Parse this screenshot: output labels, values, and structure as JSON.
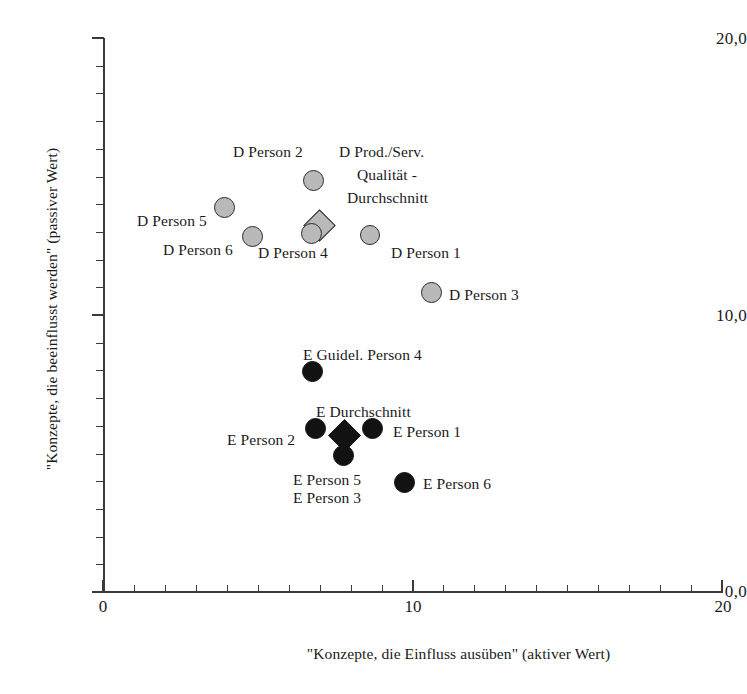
{
  "chart_data": {
    "type": "scatter",
    "title": "",
    "subtitle": "",
    "xlabel": "\"Konzepte, die Einfluss ausüben\" (aktiver Wert)",
    "ylabel": "\"Konzepte, die beeinflusst werden\" (passiver Wert)",
    "xlim": [
      0,
      20
    ],
    "ylim": [
      0,
      20
    ],
    "x_major_ticks": [
      "0",
      "10",
      "20"
    ],
    "x_major_tick_values": [
      0,
      10,
      20
    ],
    "y_major_ticks": [
      "0,0",
      "10,0",
      "20,0"
    ],
    "y_major_tick_values": [
      0,
      10,
      20
    ],
    "x_minor_tick_step": 1,
    "y_minor_tick_step": 1,
    "grid": false,
    "legend": "none",
    "series": [
      {
        "name": "D (Dimensionen) - hellgrau",
        "marker": "circle",
        "fill": "#b9b9b9",
        "edge": "#2b2b2b",
        "points": [
          {
            "label": "D Person 5",
            "x": 3.9,
            "y": 13.9
          },
          {
            "label": "D Person 6",
            "x": 4.8,
            "y": 12.9
          },
          {
            "label": "D Person 2",
            "x": 6.8,
            "y": 14.9
          },
          {
            "label": "D Person 4",
            "x": 6.7,
            "y": 13.0
          },
          {
            "label": "D Person 1",
            "x": 8.6,
            "y": 12.9
          },
          {
            "label": "D Person 3",
            "x": 10.6,
            "y": 10.8
          }
        ]
      },
      {
        "name": "D Prod./Serv. Qualität - Durchschnitt",
        "marker": "diamond",
        "fill": "#b9b9b9",
        "edge": "#2b2b2b",
        "points": [
          {
            "label": "D Prod./Serv. Qualität - Durchschnitt",
            "x": 7.0,
            "y": 13.2
          }
        ]
      },
      {
        "name": "E (Erwartungen) - schwarz",
        "marker": "circle",
        "fill": "#121212",
        "edge": "#121212",
        "points": [
          {
            "label": "E Guidel. Person 4",
            "x": 6.75,
            "y": 8.0
          },
          {
            "label": "E Person 2",
            "x": 6.85,
            "y": 5.9
          },
          {
            "label": "E Person 1",
            "x": 8.7,
            "y": 5.9
          },
          {
            "label": "E Person 5 / E Person 3",
            "x": 7.75,
            "y": 4.9
          },
          {
            "label": "E Person 6",
            "x": 9.7,
            "y": 4.0
          }
        ]
      },
      {
        "name": "E Durchschnitt",
        "marker": "diamond",
        "fill": "#121212",
        "edge": "#121212",
        "points": [
          {
            "label": "E Durchschnitt",
            "x": 7.8,
            "y": 5.7
          }
        ]
      }
    ]
  },
  "axes": {
    "x_title": "\"Konzepte, die Einfluss ausüben\" (aktiver Wert)",
    "y_title": "\"Konzepte, die beeinflusst werden\" (passiver Wert)",
    "x_labels": [
      "0",
      "10",
      "20"
    ],
    "y_labels": [
      "20,0",
      "10,0",
      "0,0"
    ]
  },
  "labels": {
    "d_person_2": "D Person 2",
    "d_prod_serv_line1": "D Prod./Serv.",
    "d_prod_serv_line2": "Qualität -",
    "d_prod_serv_line3": "Durchschnitt",
    "d_person_5": "D Person 5",
    "d_person_6": "D Person 6",
    "d_person_4": "D Person 4",
    "d_person_1": "D Person 1",
    "d_person_3": "D Person 3",
    "e_guidel_person_4": "E Guidel. Person 4",
    "e_durchschnitt": "E Durchschnitt",
    "e_person_2": "E Person 2",
    "e_person_1": "E Person 1",
    "e_person_5": "E Person 5",
    "e_person_3": "E Person 3",
    "e_person_6": "E Person 6"
  }
}
